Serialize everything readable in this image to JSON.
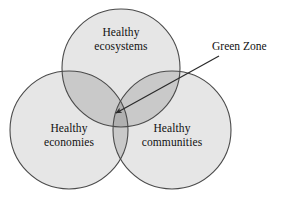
{
  "diagram": {
    "type": "venn-3-circle",
    "background_color": "#ffffff",
    "outline_color": "#4a4a4a",
    "text_color": "#111111",
    "fill_single": "#e6e6e6",
    "fill_pair": "#c9c9c9",
    "fill_triple": "#b0b0b0",
    "circles": [
      {
        "id": "ecosystems",
        "line1": "Healthy",
        "line2": "ecosystems",
        "cx": 121,
        "cy": 68,
        "r": 59
      },
      {
        "id": "economies",
        "line1": "Healthy",
        "line2": "economies",
        "cx": 69,
        "cy": 130,
        "r": 59
      },
      {
        "id": "communities",
        "line1": "Healthy",
        "line2": "communities",
        "cx": 172,
        "cy": 130,
        "r": 59
      }
    ],
    "annotation": {
      "label": "Green Zone",
      "arrow_tail_x": 219,
      "arrow_tail_y": 56,
      "arrow_tip_x": 116,
      "arrow_tip_y": 113,
      "target": "triple-intersection"
    }
  }
}
